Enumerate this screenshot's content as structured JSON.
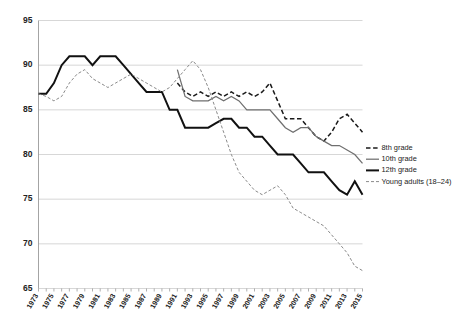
{
  "chart_data": {
    "type": "line",
    "title": "",
    "subtitle": "",
    "xlabel": "",
    "ylabel": "",
    "grid": "horizontal",
    "legend_position": "right",
    "xlim": [
      1973,
      2015
    ],
    "ylim": [
      65,
      95
    ],
    "yticks": [
      "65",
      "70",
      "75",
      "80",
      "85",
      "90",
      "95"
    ],
    "ytick_values": [
      65,
      70,
      75,
      80,
      85,
      90,
      95
    ],
    "xticks": [
      "1973",
      "1975",
      "1977",
      "1979",
      "1981",
      "1983",
      "1985",
      "1987",
      "1989",
      "1991",
      "1993",
      "1995",
      "1997",
      "1999",
      "2001",
      "2003",
      "2005",
      "2007",
      "2009",
      "2011",
      "2013",
      "2015"
    ],
    "xtick_values": [
      1973,
      1975,
      1977,
      1979,
      1981,
      1983,
      1985,
      1987,
      1989,
      1991,
      1993,
      1995,
      1997,
      1999,
      2001,
      2003,
      2005,
      2007,
      2009,
      2011,
      2013,
      2015
    ],
    "x": [
      1973,
      1974,
      1975,
      1976,
      1977,
      1978,
      1979,
      1980,
      1981,
      1982,
      1983,
      1984,
      1985,
      1986,
      1987,
      1988,
      1989,
      1990,
      1991,
      1992,
      1993,
      1994,
      1995,
      1996,
      1997,
      1998,
      1999,
      2000,
      2001,
      2002,
      2003,
      2004,
      2005,
      2006,
      2007,
      2008,
      2009,
      2010,
      2011,
      2012,
      2013,
      2014,
      2015
    ],
    "series": [
      {
        "name": "8th grade",
        "style": "dashed",
        "color": "#1a1a1a",
        "x": [
          1991,
          1992,
          1993,
          1994,
          1995,
          1996,
          1997,
          1998,
          1999,
          2000,
          2001,
          2002,
          2003,
          2004,
          2005,
          2006,
          2007,
          2008,
          2009,
          2010,
          2011,
          2012,
          2013,
          2014,
          2015
        ],
        "values": [
          88.0,
          87.0,
          86.5,
          87.0,
          86.5,
          87.0,
          86.5,
          87.0,
          86.5,
          87.0,
          86.5,
          87.0,
          88.0,
          86.0,
          84.0,
          84.0,
          84.0,
          83.0,
          82.0,
          81.5,
          82.5,
          84.0,
          84.5,
          83.5,
          82.5
        ]
      },
      {
        "name": "10th grade",
        "style": "solid-thin",
        "color": "#6f6f6f",
        "x": [
          1991,
          1992,
          1993,
          1994,
          1995,
          1996,
          1997,
          1998,
          1999,
          2000,
          2001,
          2002,
          2003,
          2004,
          2005,
          2006,
          2007,
          2008,
          2009,
          2010,
          2011,
          2012,
          2013,
          2014,
          2015
        ],
        "values": [
          89.5,
          86.5,
          86.0,
          86.0,
          86.0,
          86.5,
          86.0,
          86.5,
          86.0,
          85.0,
          85.0,
          85.0,
          85.0,
          84.0,
          83.0,
          82.5,
          83.0,
          83.0,
          82.0,
          81.5,
          81.0,
          81.0,
          80.5,
          80.0,
          79.0
        ]
      },
      {
        "name": "12th grade",
        "style": "solid-thick",
        "color": "#111111",
        "x": [
          1973,
          1974,
          1975,
          1976,
          1977,
          1978,
          1979,
          1980,
          1981,
          1982,
          1983,
          1984,
          1985,
          1986,
          1987,
          1988,
          1989,
          1990,
          1991,
          1992,
          1993,
          1994,
          1995,
          1996,
          1997,
          1998,
          1999,
          2000,
          2001,
          2002,
          2003,
          2004,
          2005,
          2006,
          2007,
          2008,
          2009,
          2010,
          2011,
          2012,
          2013,
          2014,
          2015
        ],
        "values": [
          86.8,
          86.8,
          88.0,
          90.0,
          91.0,
          91.0,
          91.0,
          90.0,
          91.0,
          91.0,
          91.0,
          90.0,
          89.0,
          88.0,
          87.0,
          87.0,
          87.0,
          85.0,
          85.0,
          83.0,
          83.0,
          83.0,
          83.0,
          83.5,
          84.0,
          84.0,
          83.0,
          83.0,
          82.0,
          82.0,
          81.0,
          80.0,
          80.0,
          80.0,
          79.0,
          78.0,
          78.0,
          78.0,
          77.0,
          76.0,
          75.5,
          77.0,
          75.5
        ]
      },
      {
        "name": "Young adults (18–24)",
        "style": "dotted",
        "color": "#8a8a8a",
        "x": [
          1973,
          1974,
          1975,
          1976,
          1977,
          1978,
          1979,
          1980,
          1981,
          1982,
          1983,
          1984,
          1985,
          1986,
          1987,
          1988,
          1989,
          1990,
          1991,
          1992,
          1993,
          1994,
          1995,
          1996,
          1997,
          1998,
          1999,
          2000,
          2001,
          2002,
          2003,
          2004,
          2005,
          2006,
          2007,
          2008,
          2009,
          2010,
          2011,
          2012,
          2013,
          2014,
          2015
        ],
        "values": [
          86.8,
          86.5,
          86.0,
          86.5,
          88.0,
          89.0,
          89.5,
          88.5,
          88.0,
          87.5,
          88.0,
          88.5,
          89.0,
          88.5,
          88.0,
          87.5,
          87.0,
          87.5,
          88.5,
          89.5,
          90.5,
          89.5,
          87.5,
          85.0,
          82.5,
          80.0,
          78.0,
          77.0,
          76.0,
          75.5,
          76.0,
          76.5,
          75.5,
          74.0,
          73.5,
          73.0,
          72.5,
          72.0,
          71.0,
          70.0,
          69.0,
          67.5,
          67.0
        ]
      }
    ]
  },
  "legend": {
    "items": [
      {
        "label": "8th grade"
      },
      {
        "label": "10th grade"
      },
      {
        "label": "12th grade"
      },
      {
        "label": "Young adults (18–24)"
      }
    ]
  }
}
